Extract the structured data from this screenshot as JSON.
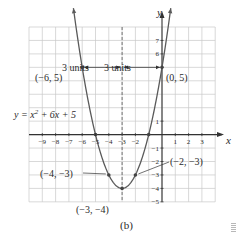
{
  "chart_data": {
    "type": "line",
    "title": "",
    "caption": "(b)",
    "equation_label": "y = x² + 6x + 5",
    "xlabel": "x",
    "ylabel": "y",
    "xlim": [
      -10,
      4
    ],
    "ylim": [
      -5,
      8
    ],
    "grid": true,
    "x_ticks": [
      -9,
      -8,
      -7,
      -6,
      -5,
      -4,
      -3,
      -2,
      1,
      2,
      3
    ],
    "x_tick_labels": [
      "−9",
      "−8",
      "−7",
      "−6",
      "−5",
      "−4",
      "−3",
      "−2",
      "1",
      "2",
      "3"
    ],
    "y_ticks": [
      7,
      6,
      1,
      -1,
      -2,
      -3,
      -4,
      -5
    ],
    "y_tick_labels": [
      "7",
      "6",
      "1",
      "−1",
      "−2",
      "−3",
      "−4",
      "−5"
    ],
    "series": [
      {
        "name": "y = x² + 6x + 5",
        "function": "x^2 + 6x + 5",
        "x": [
          -7.6,
          -7,
          -6,
          -5,
          -4,
          -3,
          -2,
          -1,
          0,
          0.6
        ],
        "y": [
          10.16,
          12,
          5,
          0,
          -3,
          -4,
          -3,
          0,
          5,
          8.96
        ]
      }
    ],
    "axis_of_symmetry": {
      "x": -3,
      "style": "dashed"
    },
    "labeled_points": [
      {
        "x": -6,
        "y": 5,
        "label": "(−6, 5)"
      },
      {
        "x": 0,
        "y": 5,
        "label": "(0, 5)"
      },
      {
        "x": -4,
        "y": -3,
        "label": "(−4, −3)"
      },
      {
        "x": -2,
        "y": -3,
        "label": "(−2, −3)"
      },
      {
        "x": -3,
        "y": -4,
        "label": "(−3, −4)"
      }
    ],
    "intercepts": [
      {
        "x": -5,
        "y": 0
      },
      {
        "x": -1,
        "y": 0
      }
    ],
    "annotations": [
      {
        "text": "3 units",
        "from_x": -6,
        "to_x": -3,
        "y": 5
      },
      {
        "text": "3 units",
        "from_x": -3,
        "to_x": 0,
        "y": 5
      }
    ]
  },
  "labels": {
    "x_axis": "x",
    "y_axis": "y",
    "equation": "y = x² + 6x + 5",
    "caption": "(b)",
    "units_left": "3 units",
    "units_right": "3 units",
    "pt_neg6_5": "(−6, 5)",
    "pt_0_5": "(0, 5)",
    "pt_neg4_neg3": "(−4, −3)",
    "pt_neg2_neg3": "(−2, −3)",
    "pt_vertex": "(−3, −4)"
  }
}
